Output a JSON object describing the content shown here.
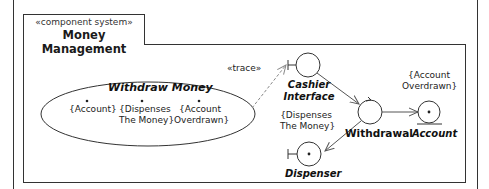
{
  "frame": {
    "stereotype": "«component system»",
    "title": "Money Management"
  },
  "use_case": {
    "name": "Withdraw Money",
    "extension_points": [
      {
        "label_line1": "{Account}",
        "label_line2": ""
      },
      {
        "label_line1": "{Dispenses",
        "label_line2": "The Money}"
      },
      {
        "label_line1": "{Account",
        "label_line2": "Overdrawn}"
      }
    ]
  },
  "trace_label": "«trace»",
  "elements": {
    "cashier_interface": {
      "line1": "Cashier",
      "line2": "Interface",
      "kind": "boundary"
    },
    "withdrawal": {
      "label": "Withdrawal",
      "kind": "control"
    },
    "account": {
      "label": "Account",
      "kind": "entity"
    },
    "dispenser": {
      "label": "Dispenser",
      "kind": "boundary"
    }
  },
  "notes": {
    "account_overdrawn": {
      "line1": "{Account",
      "line2": "Overdrawn}"
    },
    "dispenses_money": {
      "line1": "{Dispenses",
      "line2": "The Money}"
    }
  },
  "colors": {
    "line": "#333333",
    "trace_line": "#777777"
  }
}
